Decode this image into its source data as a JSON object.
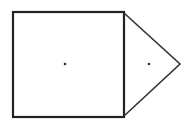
{
  "diagram": {
    "stroke_color": "#222222",
    "background": "#ffffff",
    "square": {
      "x": 13,
      "y": 12,
      "width": 111,
      "height": 105
    },
    "triangle": {
      "points": "124,13 180,64 124,116"
    },
    "square_center_dot": {
      "cx": 65,
      "cy": 64
    },
    "triangle_center_dot": {
      "cx": 149,
      "cy": 64
    }
  }
}
